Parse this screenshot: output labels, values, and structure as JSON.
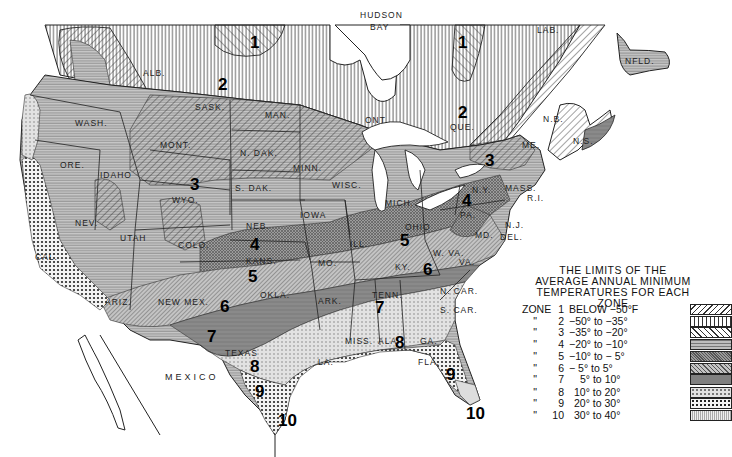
{
  "legend": {
    "title_lines": [
      "THE LIMITS OF THE",
      "AVERAGE ANNUAL MINIMUM",
      "TEMPERATURES FOR EACH ZONE"
    ],
    "rows": [
      {
        "prefix": "ZONE",
        "zone": "1",
        "range": "BELOW  −50°F",
        "pattern": "diag-back-coarse"
      },
      {
        "prefix": "\"",
        "zone": "2",
        "range": "−50°  to −35°",
        "pattern": "vertical-lines"
      },
      {
        "prefix": "\"",
        "zone": "3",
        "range": "−35°  to −20°",
        "pattern": "diag-fwd"
      },
      {
        "prefix": "\"",
        "zone": "4",
        "range": "−20°  to −10°",
        "pattern": "horizontal-gray"
      },
      {
        "prefix": "\"",
        "zone": "5",
        "range": "−10°  to −  5°",
        "pattern": "crosshatch-dark"
      },
      {
        "prefix": "\"",
        "zone": "6",
        "range": "−  5°  to      5°",
        "pattern": "diag-fine"
      },
      {
        "prefix": "\"",
        "zone": "7",
        "range": "5°  to    10°",
        "pattern": "solid-dark"
      },
      {
        "prefix": "\"",
        "zone": "8",
        "range": "10°  to    20°",
        "pattern": "light-dots"
      },
      {
        "prefix": "\"",
        "zone": "9",
        "range": "20°  to    30°",
        "pattern": "coarse-dots"
      },
      {
        "prefix": "\"",
        "zone": "10",
        "range": "30°  to    40°",
        "pattern": "fine-vertical"
      }
    ]
  },
  "region_labels": {
    "hudson_bay": [
      "HUDSON",
      "BAY"
    ],
    "mexico": "MEXICO",
    "provinces": [
      {
        "id": "alb",
        "text": "ALB."
      },
      {
        "id": "sask",
        "text": "SASK."
      },
      {
        "id": "man",
        "text": "MAN."
      },
      {
        "id": "ont",
        "text": "ONT."
      },
      {
        "id": "que",
        "text": "QUE."
      },
      {
        "id": "lab",
        "text": "LAB."
      },
      {
        "id": "nfld",
        "text": "NFLD."
      },
      {
        "id": "nb",
        "text": "N.B."
      },
      {
        "id": "ns",
        "text": "N.S."
      }
    ],
    "states": [
      {
        "id": "wash",
        "text": "WASH."
      },
      {
        "id": "ore",
        "text": "ORE."
      },
      {
        "id": "cal",
        "text": "CAL."
      },
      {
        "id": "idaho",
        "text": "IDAHO"
      },
      {
        "id": "nev",
        "text": "NEV."
      },
      {
        "id": "mont",
        "text": "MONT."
      },
      {
        "id": "wyo",
        "text": "WYO."
      },
      {
        "id": "utah",
        "text": "UTAH"
      },
      {
        "id": "colo",
        "text": "COLO."
      },
      {
        "id": "ariz",
        "text": "ARIZ."
      },
      {
        "id": "newmex",
        "text": "NEW MEX."
      },
      {
        "id": "ndak",
        "text": "N. DAK."
      },
      {
        "id": "sdak",
        "text": "S. DAK."
      },
      {
        "id": "neb",
        "text": "NEB."
      },
      {
        "id": "kans",
        "text": "KANS."
      },
      {
        "id": "okla",
        "text": "OKLA."
      },
      {
        "id": "texas",
        "text": "TEXAS"
      },
      {
        "id": "minn",
        "text": "MINN."
      },
      {
        "id": "iowa",
        "text": "IOWA"
      },
      {
        "id": "mo",
        "text": "MO."
      },
      {
        "id": "ark",
        "text": "ARK."
      },
      {
        "id": "la",
        "text": "LA."
      },
      {
        "id": "wisc",
        "text": "WISC."
      },
      {
        "id": "ill",
        "text": "ILL."
      },
      {
        "id": "mich",
        "text": "MICH."
      },
      {
        "id": "ind",
        "text": "IND."
      },
      {
        "id": "ohio",
        "text": "OHIO"
      },
      {
        "id": "ky",
        "text": "KY."
      },
      {
        "id": "tenn",
        "text": "TENN."
      },
      {
        "id": "miss",
        "text": "MISS."
      },
      {
        "id": "ala",
        "text": "ALA."
      },
      {
        "id": "ga",
        "text": "GA."
      },
      {
        "id": "fla",
        "text": "FLA."
      },
      {
        "id": "scar",
        "text": "S. CAR."
      },
      {
        "id": "ncar",
        "text": "N. CAR."
      },
      {
        "id": "va",
        "text": "VA."
      },
      {
        "id": "wva",
        "text": "W. VA."
      },
      {
        "id": "pa",
        "text": "PA."
      },
      {
        "id": "ny",
        "text": "N.Y."
      },
      {
        "id": "nj",
        "text": "N.J."
      },
      {
        "id": "del",
        "text": "DEL."
      },
      {
        "id": "md",
        "text": "MD."
      },
      {
        "id": "me",
        "text": "ME."
      },
      {
        "id": "mass",
        "text": "MASS."
      },
      {
        "id": "ri",
        "text": "R.I."
      }
    ]
  },
  "zone_markers": [
    {
      "zone": "1",
      "where": "north-central canada"
    },
    {
      "zone": "1",
      "where": "quebec"
    },
    {
      "zone": "2",
      "where": "saskatchewan"
    },
    {
      "zone": "2",
      "where": "quebec"
    },
    {
      "zone": "3",
      "where": "wyoming"
    },
    {
      "zone": "3",
      "where": "ontario/quebec border"
    },
    {
      "zone": "4",
      "where": "nebraska/kansas"
    },
    {
      "zone": "4",
      "where": "new york/pennsylvania"
    },
    {
      "zone": "5",
      "where": "kansas/oklahoma"
    },
    {
      "zone": "5",
      "where": "ohio"
    },
    {
      "zone": "6",
      "where": "new mexico"
    },
    {
      "zone": "6",
      "where": "kentucky/virginia"
    },
    {
      "zone": "7",
      "where": "texas"
    },
    {
      "zone": "7",
      "where": "tennessee"
    },
    {
      "zone": "8",
      "where": "texas"
    },
    {
      "zone": "8",
      "where": "alabama/georgia"
    },
    {
      "zone": "9",
      "where": "texas gulf"
    },
    {
      "zone": "9",
      "where": "florida"
    },
    {
      "zone": "10",
      "where": "south texas"
    },
    {
      "zone": "10",
      "where": "south florida"
    }
  ]
}
